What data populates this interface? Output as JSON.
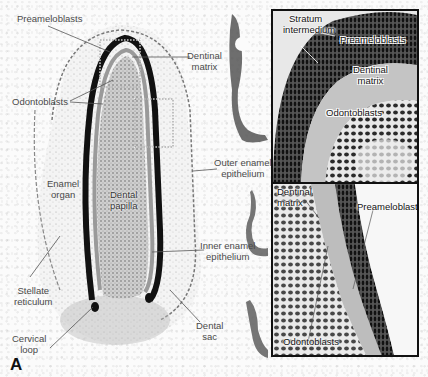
{
  "figure": {
    "panel_letter": "A",
    "main_labels": {
      "preameloblasts": "Preameloblasts",
      "dentinal_matrix_line1": "Dentinal",
      "dentinal_matrix_line2": "matrix",
      "odontoblasts": "Odontoblasts",
      "outer_enamel_line1": "Outer enamel",
      "outer_enamel_line2": "epithelium",
      "enamel_organ_line1": "Enamel",
      "enamel_organ_line2": "organ",
      "dental_papilla_line1": "Dental",
      "dental_papilla_line2": "papilla",
      "inner_enamel_line1": "Inner enamel",
      "inner_enamel_line2": "epithelium",
      "stellate_line1": "Stellate",
      "stellate_line2": "reticulum",
      "cervical_loop_line1": "Cervical",
      "cervical_loop_line2": "loop",
      "dental_sac_line1": "Dental",
      "dental_sac_line2": "sac"
    },
    "inset_top_labels": {
      "stratum_line1": "Stratum",
      "stratum_line2": "intermedium",
      "preameloblasts": "Preameloblasts",
      "dentinal_matrix_line1": "Dentinal",
      "dentinal_matrix_line2": "matrix",
      "odontoblasts": "Odontoblasts"
    },
    "inset_bottom_labels": {
      "dentinal_matrix_line1": "Dentinal",
      "dentinal_matrix_line2": "matrix",
      "preameloblasts": "Preameloblasts",
      "odontoblasts": "Odontoblasts"
    },
    "colors": {
      "background": "#fbfbfb",
      "tissue_dark": "#1a1a1a",
      "tissue_mid": "#8a8a8a",
      "label_text": "#4a4a4a",
      "leader_line": "#555555",
      "inset_border": "#111111"
    }
  }
}
